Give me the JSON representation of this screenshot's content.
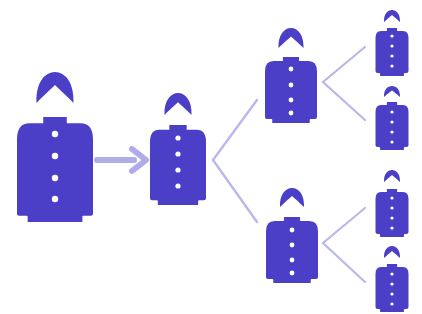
{
  "diagram": {
    "title": "Referral / pyramid growth diagram",
    "width": 422,
    "height": 314,
    "background": "#ffffff",
    "colors": {
      "figure": "#4b3fc8",
      "button_dot": "#ffffff",
      "connector": "#b9b8ec",
      "arrow": "#aeace9"
    },
    "figures": [
      {
        "id": "person-root",
        "level": 0,
        "cx": 55,
        "headTop": 72,
        "headW": 37,
        "headH": 31,
        "collarTop": 117,
        "bodyW": 76,
        "bottom": 222,
        "buttons": [
          134,
          156,
          178,
          199
        ],
        "dotR": 3.2
      },
      {
        "id": "person-level1",
        "level": 1,
        "cx": 178,
        "headTop": 93,
        "headW": 27,
        "headH": 22,
        "collarTop": 125,
        "bodyW": 56,
        "bottom": 205,
        "buttons": [
          138,
          154,
          170,
          186
        ],
        "dotR": 2.6
      },
      {
        "id": "person-level2-top",
        "level": 2,
        "cx": 291,
        "headTop": 28,
        "headW": 25,
        "headH": 20,
        "collarTop": 57,
        "bodyW": 52,
        "bottom": 123,
        "buttons": [
          69,
          85,
          100,
          113
        ],
        "dotR": 2.4
      },
      {
        "id": "person-level2-bottom",
        "level": 2,
        "cx": 292,
        "headTop": 188,
        "headW": 24,
        "headH": 19,
        "collarTop": 217,
        "bodyW": 52,
        "bottom": 283,
        "buttons": [
          230,
          245,
          260,
          273
        ],
        "dotR": 2.4
      },
      {
        "id": "person-level3-a",
        "level": 3,
        "cx": 392,
        "headTop": 10,
        "headW": 16,
        "headH": 12,
        "collarTop": 28,
        "bodyW": 33,
        "bottom": 76,
        "buttons": [
          36,
          46,
          56,
          66
        ],
        "dotR": 1.6
      },
      {
        "id": "person-level3-b",
        "level": 3,
        "cx": 392,
        "headTop": 86,
        "headW": 16,
        "headH": 11,
        "collarTop": 102,
        "bodyW": 33,
        "bottom": 150,
        "buttons": [
          112,
          122,
          132,
          142
        ],
        "dotR": 1.6
      },
      {
        "id": "person-level3-c",
        "level": 3,
        "cx": 392,
        "headTop": 170,
        "headW": 16,
        "headH": 12,
        "collarTop": 189,
        "bodyW": 33,
        "bottom": 237,
        "buttons": [
          198,
          208,
          218,
          228
        ],
        "dotR": 1.6
      },
      {
        "id": "person-level3-d",
        "level": 3,
        "cx": 392,
        "headTop": 246,
        "headW": 16,
        "headH": 12,
        "collarTop": 264,
        "bodyW": 33,
        "bottom": 312,
        "buttons": [
          274,
          284,
          294,
          304
        ],
        "dotR": 1.6
      }
    ],
    "arrow": {
      "from": "person-root",
      "to": "person-level1",
      "x1": 97,
      "y": 160,
      "x2": 146,
      "shaftWidth": 6,
      "headLength": 14,
      "headHalfHeight": 11
    },
    "connectors": [
      {
        "from": "person-level1",
        "to": [
          "person-level2-top",
          "person-level2-bottom"
        ],
        "vertex": [
          213,
          160
        ],
        "ends": [
          [
            257,
            100
          ],
          [
            257,
            222
          ]
        ],
        "width": 2.4
      },
      {
        "from": "person-level2-top",
        "to": [
          "person-level3-a",
          "person-level3-b"
        ],
        "vertex": [
          323,
          82
        ],
        "ends": [
          [
            365,
            47
          ],
          [
            365,
            120
          ]
        ],
        "width": 2.2
      },
      {
        "from": "person-level2-bottom",
        "to": [
          "person-level3-c",
          "person-level3-d"
        ],
        "vertex": [
          323,
          243
        ],
        "ends": [
          [
            365,
            208
          ],
          [
            365,
            282
          ]
        ],
        "width": 2.2
      }
    ]
  }
}
